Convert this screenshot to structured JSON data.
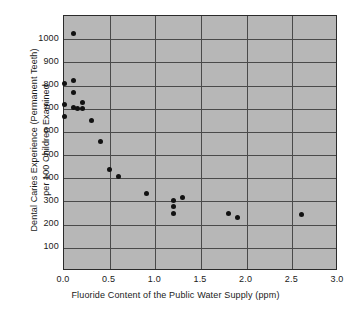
{
  "chart_data": {
    "type": "scatter",
    "title": "",
    "xlabel": "Fluoride Content of the Public Water Supply (ppm)",
    "ylabel": "Dental Caries Experience (Permanent Teeth) per 100 Children Examined",
    "ylabel_line1": "Dental Caries Experience (Permanent Teeth)",
    "ylabel_line2": "per 100 Children Examined",
    "xlim": [
      0.0,
      3.0
    ],
    "ylim": [
      0,
      1100
    ],
    "xticks": [
      0.0,
      0.5,
      1.0,
      1.5,
      2.0,
      2.5,
      3.0
    ],
    "xtick_labels": [
      "0.0",
      "0.5",
      "1.0",
      "1.5",
      "2.0",
      "2.5",
      "3.0"
    ],
    "yticks": [
      100,
      200,
      300,
      400,
      500,
      600,
      700,
      800,
      900,
      1000
    ],
    "ytick_labels": [
      "100",
      "200",
      "300",
      "400",
      "500",
      "600",
      "700",
      "800",
      "900",
      "1000"
    ],
    "grid": true,
    "legend": null,
    "plot_background_color": "#b7b7b7",
    "point_color": "#121212",
    "axis_color": "#2b2b2b",
    "grid_color": "#4a4a4a",
    "x": [
      0.0,
      0.0,
      0.0,
      0.1,
      0.1,
      0.1,
      0.1,
      0.15,
      0.2,
      0.2,
      0.3,
      0.4,
      0.5,
      0.6,
      0.9,
      1.2,
      1.2,
      1.2,
      1.3,
      1.8,
      1.9,
      2.6
    ],
    "y": [
      810,
      720,
      665,
      1025,
      820,
      770,
      705,
      700,
      728,
      700,
      650,
      557,
      440,
      408,
      335,
      303,
      278,
      247,
      315,
      247,
      232,
      242
    ],
    "points": [
      {
        "x": 0.0,
        "y": 810
      },
      {
        "x": 0.0,
        "y": 720
      },
      {
        "x": 0.0,
        "y": 665
      },
      {
        "x": 0.1,
        "y": 1025
      },
      {
        "x": 0.1,
        "y": 820
      },
      {
        "x": 0.1,
        "y": 770
      },
      {
        "x": 0.1,
        "y": 705
      },
      {
        "x": 0.15,
        "y": 700
      },
      {
        "x": 0.2,
        "y": 728
      },
      {
        "x": 0.2,
        "y": 700
      },
      {
        "x": 0.3,
        "y": 650
      },
      {
        "x": 0.4,
        "y": 557
      },
      {
        "x": 0.5,
        "y": 440
      },
      {
        "x": 0.6,
        "y": 408
      },
      {
        "x": 0.9,
        "y": 335
      },
      {
        "x": 1.2,
        "y": 303
      },
      {
        "x": 1.2,
        "y": 278
      },
      {
        "x": 1.2,
        "y": 247
      },
      {
        "x": 1.3,
        "y": 315
      },
      {
        "x": 1.8,
        "y": 247
      },
      {
        "x": 1.9,
        "y": 232
      },
      {
        "x": 2.6,
        "y": 242
      }
    ]
  }
}
